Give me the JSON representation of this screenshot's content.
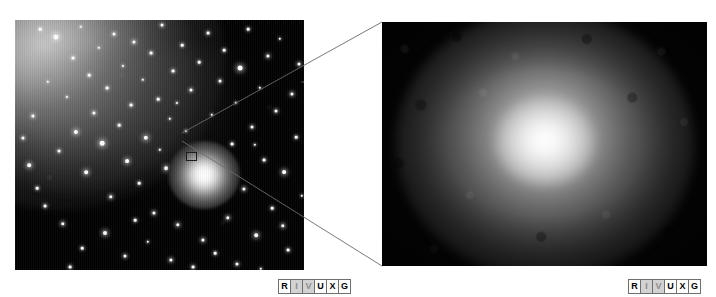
{
  "figure": {
    "background_color": "#ffffff",
    "width": 716,
    "height": 297
  },
  "panels": [
    {
      "id": "wide-field",
      "name": "left-wide-field-image",
      "x": 15,
      "y": 20,
      "width": 289,
      "height": 250,
      "background_color": "#000000",
      "description": "Wide-field星 star field with diffuse galaxy glow at upper left and a bright compact object at center"
    },
    {
      "id": "close-up",
      "name": "right-closeup-image",
      "x": 382,
      "y": 22,
      "width": 325,
      "height": 244,
      "background_color": "#050505",
      "description": "Magnified view of the boxed region showing a diffuse bright core"
    }
  ],
  "roi_box": {
    "x": 171,
    "y": 132,
    "width": 11,
    "height": 9,
    "border_color": "#1a1a1a"
  },
  "connectors": {
    "color": "#6b6b6b",
    "width": 0.9,
    "lines": [
      {
        "name": "upper-connector",
        "x1": 182,
        "y1": 133,
        "x2": 382,
        "y2": 22
      },
      {
        "name": "lower-connector",
        "x1": 182,
        "y1": 141,
        "x2": 382,
        "y2": 266
      }
    ]
  },
  "spectrum_labels": {
    "left": {
      "bands": [
        {
          "letter": "R",
          "state": "active"
        },
        {
          "letter": "I",
          "state": "dim"
        },
        {
          "letter": "V",
          "state": "dim"
        },
        {
          "letter": "U",
          "state": "active"
        },
        {
          "letter": "X",
          "state": "active"
        },
        {
          "letter": "G",
          "state": "active"
        }
      ]
    },
    "right": {
      "bands": [
        {
          "letter": "R",
          "state": "active"
        },
        {
          "letter": "I",
          "state": "dim"
        },
        {
          "letter": "V",
          "state": "dim"
        },
        {
          "letter": "U",
          "state": "active"
        },
        {
          "letter": "X",
          "state": "active"
        },
        {
          "letter": "G",
          "state": "active"
        }
      ]
    }
  },
  "left_panel_stars": [
    {
      "x": 18,
      "y": 96,
      "r": 1.6
    },
    {
      "x": 25,
      "y": 9,
      "r": 1.3
    },
    {
      "x": 33,
      "y": 62,
      "r": 1.2
    },
    {
      "x": 41,
      "y": 17,
      "r": 2.6
    },
    {
      "x": 44,
      "y": 131,
      "r": 1.5
    },
    {
      "x": 52,
      "y": 77,
      "r": 1.1
    },
    {
      "x": 58,
      "y": 38,
      "r": 1.4
    },
    {
      "x": 61,
      "y": 112,
      "r": 2.1
    },
    {
      "x": 66,
      "y": 7,
      "r": 1.2
    },
    {
      "x": 71,
      "y": 152,
      "r": 1.8
    },
    {
      "x": 74,
      "y": 55,
      "r": 1.3
    },
    {
      "x": 79,
      "y": 93,
      "r": 1.6
    },
    {
      "x": 84,
      "y": 28,
      "r": 1.2
    },
    {
      "x": 87,
      "y": 123,
      "r": 2.3
    },
    {
      "x": 92,
      "y": 68,
      "r": 1.4
    },
    {
      "x": 96,
      "y": 177,
      "r": 1.7
    },
    {
      "x": 99,
      "y": 14,
      "r": 1.5
    },
    {
      "x": 104,
      "y": 105,
      "r": 1.3
    },
    {
      "x": 108,
      "y": 46,
      "r": 1.1
    },
    {
      "x": 112,
      "y": 141,
      "r": 1.9
    },
    {
      "x": 116,
      "y": 85,
      "r": 1.4
    },
    {
      "x": 119,
      "y": 22,
      "r": 1.6
    },
    {
      "x": 124,
      "y": 163,
      "r": 1.3
    },
    {
      "x": 128,
      "y": 60,
      "r": 1.2
    },
    {
      "x": 131,
      "y": 118,
      "r": 2.2
    },
    {
      "x": 136,
      "y": 33,
      "r": 1.4
    },
    {
      "x": 139,
      "y": 193,
      "r": 1.6
    },
    {
      "x": 143,
      "y": 79,
      "r": 1.3
    },
    {
      "x": 147,
      "y": 5,
      "r": 1.5
    },
    {
      "x": 151,
      "y": 148,
      "r": 1.8
    },
    {
      "x": 155,
      "y": 99,
      "r": 1.2
    },
    {
      "x": 158,
      "y": 51,
      "r": 1.4
    },
    {
      "x": 163,
      "y": 205,
      "r": 1.7
    },
    {
      "x": 167,
      "y": 25,
      "r": 1.3
    },
    {
      "x": 171,
      "y": 111,
      "r": 1.1
    },
    {
      "x": 176,
      "y": 70,
      "r": 1.5
    },
    {
      "x": 180,
      "y": 180,
      "r": 2.0
    },
    {
      "x": 184,
      "y": 42,
      "r": 1.3
    },
    {
      "x": 188,
      "y": 220,
      "r": 1.6
    },
    {
      "x": 193,
      "y": 13,
      "r": 1.4
    },
    {
      "x": 197,
      "y": 95,
      "r": 1.2
    },
    {
      "x": 201,
      "y": 157,
      "r": 1.8
    },
    {
      "x": 205,
      "y": 61,
      "r": 1.5
    },
    {
      "x": 209,
      "y": 30,
      "r": 1.3
    },
    {
      "x": 213,
      "y": 198,
      "r": 1.7
    },
    {
      "x": 217,
      "y": 124,
      "r": 1.4
    },
    {
      "x": 221,
      "y": 83,
      "r": 1.2
    },
    {
      "x": 225,
      "y": 48,
      "r": 2.4
    },
    {
      "x": 229,
      "y": 169,
      "r": 1.6
    },
    {
      "x": 233,
      "y": 9,
      "r": 1.3
    },
    {
      "x": 237,
      "y": 107,
      "r": 1.5
    },
    {
      "x": 241,
      "y": 215,
      "r": 1.8
    },
    {
      "x": 245,
      "y": 68,
      "r": 1.2
    },
    {
      "x": 249,
      "y": 140,
      "r": 1.4
    },
    {
      "x": 253,
      "y": 36,
      "r": 1.6
    },
    {
      "x": 257,
      "y": 188,
      "r": 1.3
    },
    {
      "x": 261,
      "y": 91,
      "r": 1.5
    },
    {
      "x": 265,
      "y": 19,
      "r": 1.2
    },
    {
      "x": 269,
      "y": 152,
      "r": 1.9
    },
    {
      "x": 273,
      "y": 230,
      "r": 1.4
    },
    {
      "x": 277,
      "y": 74,
      "r": 1.6
    },
    {
      "x": 281,
      "y": 117,
      "r": 1.3
    },
    {
      "x": 284,
      "y": 44,
      "r": 1.5
    },
    {
      "x": 287,
      "y": 176,
      "r": 1.2
    },
    {
      "x": 30,
      "y": 186,
      "r": 1.4
    },
    {
      "x": 48,
      "y": 204,
      "r": 1.7
    },
    {
      "x": 67,
      "y": 228,
      "r": 1.3
    },
    {
      "x": 90,
      "y": 213,
      "r": 2.0
    },
    {
      "x": 110,
      "y": 236,
      "r": 1.5
    },
    {
      "x": 133,
      "y": 222,
      "r": 1.2
    },
    {
      "x": 156,
      "y": 240,
      "r": 1.6
    },
    {
      "x": 178,
      "y": 247,
      "r": 1.4
    },
    {
      "x": 200,
      "y": 233,
      "r": 1.3
    },
    {
      "x": 222,
      "y": 244,
      "r": 1.5
    },
    {
      "x": 246,
      "y": 249,
      "r": 1.2
    },
    {
      "x": 268,
      "y": 206,
      "r": 1.7
    },
    {
      "x": 14,
      "y": 145,
      "r": 1.8
    },
    {
      "x": 22,
      "y": 168,
      "r": 1.3
    },
    {
      "x": 8,
      "y": 118,
      "r": 1.5
    },
    {
      "x": 55,
      "y": 247,
      "r": 1.4
    },
    {
      "x": 145,
      "y": 130,
      "r": 1.2
    },
    {
      "x": 162,
      "y": 83,
      "r": 1.1
    },
    {
      "x": 120,
      "y": 200,
      "r": 1.3
    },
    {
      "x": 240,
      "y": 125,
      "r": 1.2
    }
  ],
  "left_panel_bright_star": {
    "x": 298,
    "y": 62,
    "name": "bright-star-with-diffraction-spikes"
  }
}
